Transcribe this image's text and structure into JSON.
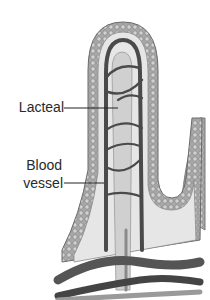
{
  "diagram": {
    "labels": [
      {
        "id": "lacteal",
        "text": "Lacteal"
      },
      {
        "id": "blood",
        "text": "Blood"
      },
      {
        "id": "vessel",
        "text": "vessel"
      }
    ],
    "label_targets": {
      "lacteal": "central lacteal channel",
      "blood_vessel": "capillary network"
    },
    "colors": {
      "background": "#ffffff",
      "epithelium": "#9a9a9a",
      "epithelium_cells": "#c8c8c8",
      "interior": "#e4e4e4",
      "vessel": "#4a4a4a",
      "lacteal": "#cfcfcf",
      "text": "#2a2a2a"
    }
  }
}
